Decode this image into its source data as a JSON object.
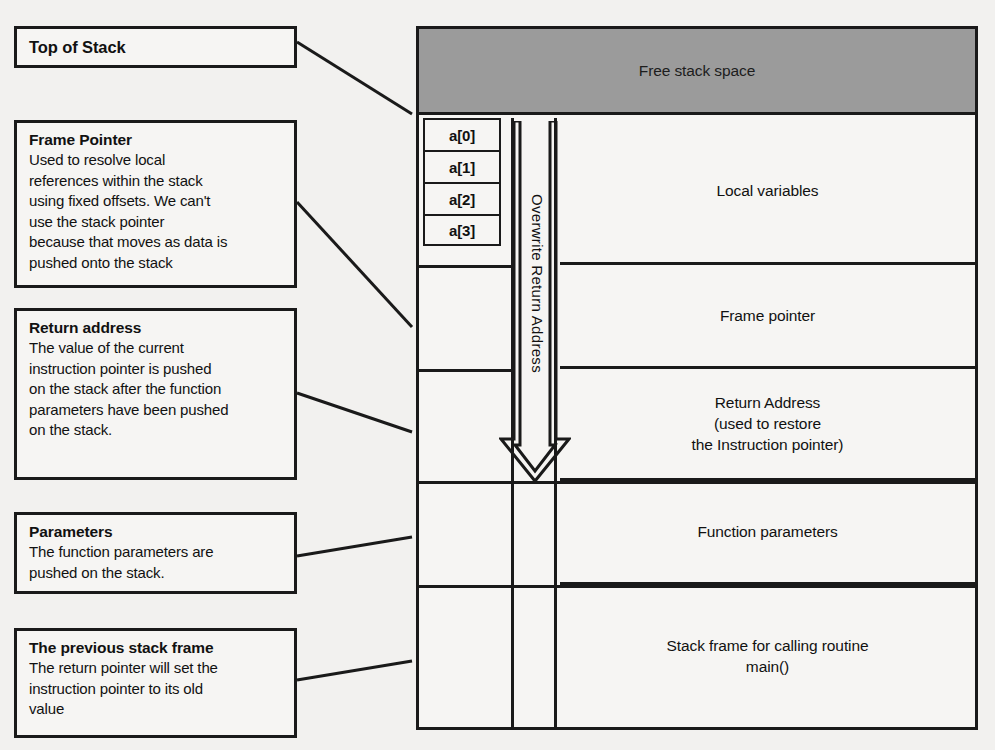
{
  "diagram": {
    "colors": {
      "ink": "#1a1a1a",
      "paper": "#f2f1ef",
      "free_space_gray": "#9b9b9b"
    }
  },
  "callouts": [
    {
      "id": "top-of-stack",
      "title": "Top of Stack",
      "body": ""
    },
    {
      "id": "frame-pointer",
      "title": "Frame Pointer",
      "body": "Used to resolve local\nreferences within the stack\nusing fixed offsets. We can't\nuse the stack pointer\nbecause that moves as data is\npushed onto the stack"
    },
    {
      "id": "return-address",
      "title": "Return address",
      "body": "The value of the current\ninstruction pointer is pushed\non the stack after the function\nparameters have been pushed\non the stack."
    },
    {
      "id": "parameters",
      "title": "Parameters",
      "body": "The function parameters are\npushed on the stack."
    },
    {
      "id": "previous-stack-frame",
      "title": "The previous stack frame",
      "body": "The return pointer will set the\ninstruction pointer to its old\nvalue"
    }
  ],
  "stack": {
    "free_space_label": "Free stack space",
    "buffer_cells": [
      {
        "label": "a[0]"
      },
      {
        "label": "a[1]"
      },
      {
        "label": "a[2]"
      },
      {
        "label": "a[3]"
      }
    ],
    "overwrite_label": "Overwrite Return Address",
    "rows": [
      {
        "id": "local-variables",
        "label": "Local variables"
      },
      {
        "id": "frame-pointer",
        "label": "Frame pointer"
      },
      {
        "id": "return-address",
        "label": "Return Address\n(used to restore\nthe Instruction pointer)"
      },
      {
        "id": "function-parameters",
        "label": "Function parameters"
      },
      {
        "id": "calling-routine",
        "label": "Stack frame for calling routine\nmain()"
      }
    ]
  }
}
